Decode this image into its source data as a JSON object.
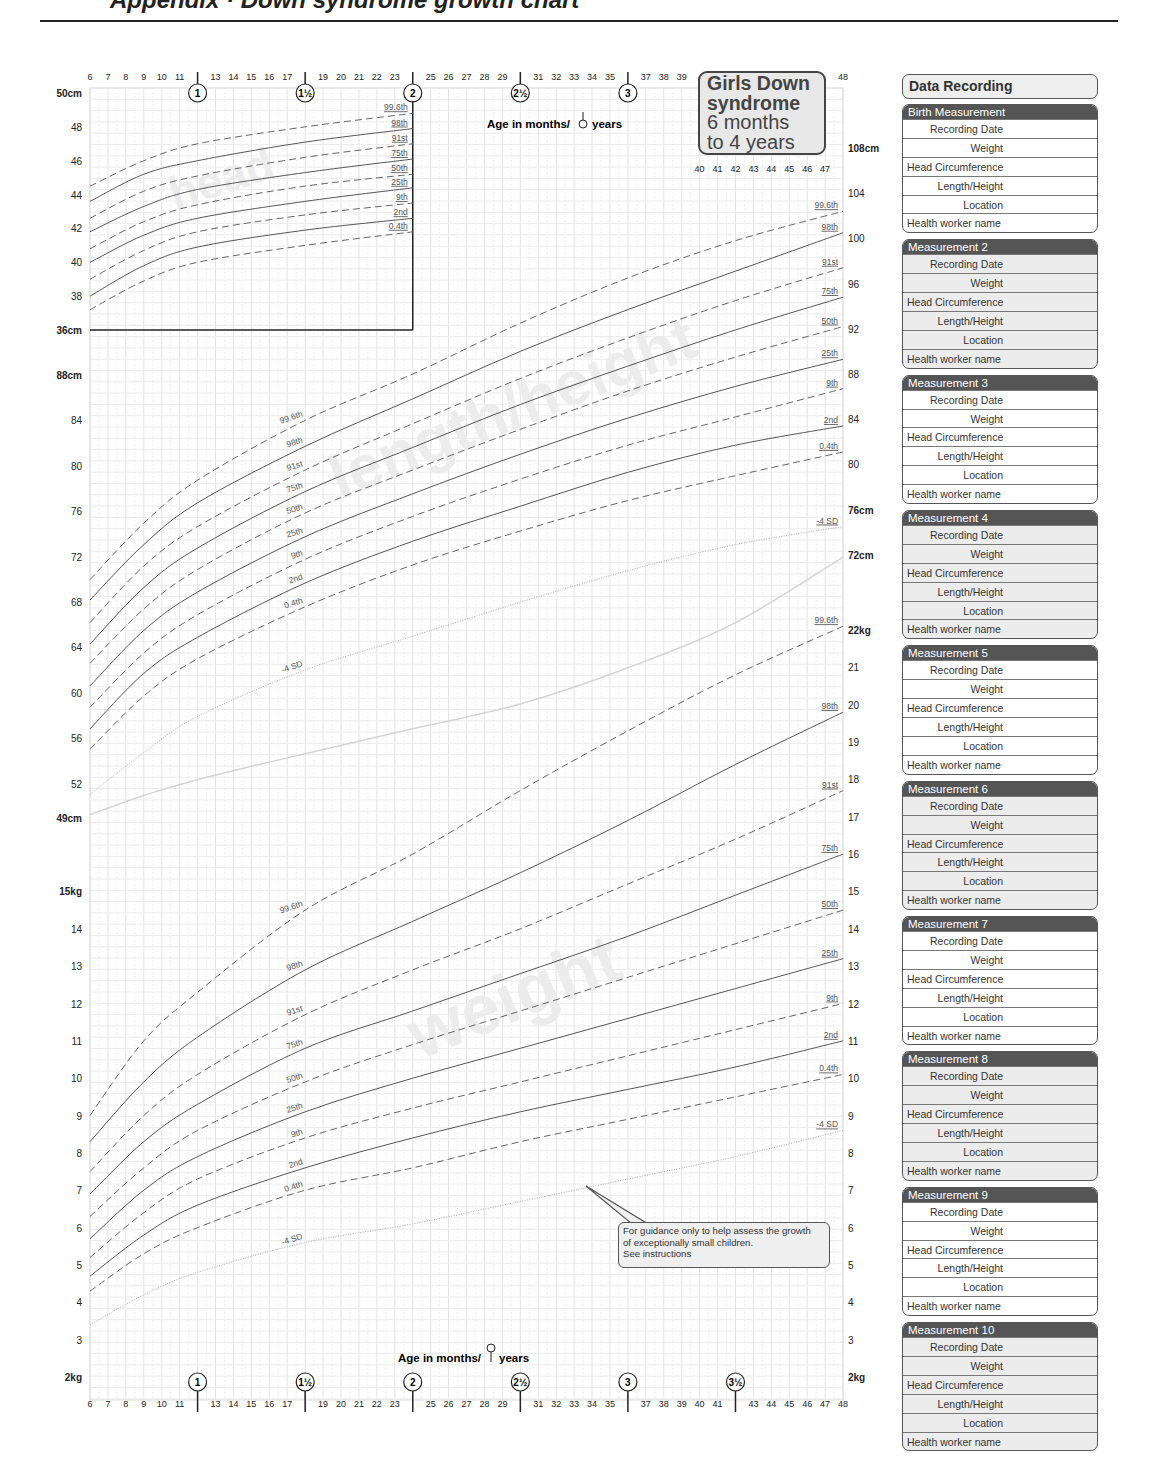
{
  "page": {
    "header_cut_text": "Appendix · Down syndrome growth chart",
    "title_box": {
      "line1": "Girls Down",
      "line2": "syndrome",
      "line3": "6 months",
      "line4": "to 4 years"
    }
  },
  "axes": {
    "top_months": [
      "6",
      "7",
      "8",
      "9",
      "10",
      "11",
      "13",
      "14",
      "15",
      "16",
      "17",
      "19",
      "20",
      "21",
      "22",
      "23",
      "25",
      "26",
      "27",
      "28",
      "29",
      "31",
      "32",
      "33",
      "34",
      "35",
      "37",
      "38",
      "39",
      "48"
    ],
    "inner_top_months": [
      "40",
      "41",
      "42",
      "43",
      "44",
      "45",
      "46",
      "47"
    ],
    "bottom_months": [
      "6",
      "7",
      "8",
      "9",
      "10",
      "11",
      "13",
      "14",
      "15",
      "16",
      "17",
      "19",
      "20",
      "21",
      "22",
      "23",
      "25",
      "26",
      "27",
      "28",
      "29",
      "31",
      "32",
      "33",
      "34",
      "35",
      "37",
      "38",
      "39",
      "40",
      "41",
      "43",
      "44",
      "45",
      "46",
      "47",
      "48"
    ],
    "year_markers_top": [
      "1",
      "1½",
      "2",
      "2½",
      "3"
    ],
    "year_markers_bottom": [
      "1",
      "1½",
      "2",
      "2½",
      "3",
      "3½"
    ],
    "top_age_label": "Age in months/",
    "top_age_label_suffix": "years",
    "bottom_age_label": "Age in months/",
    "bottom_age_label_suffix": "years",
    "head_ticks": [
      "50cm",
      "48",
      "46",
      "44",
      "42",
      "40",
      "38",
      "36cm"
    ],
    "length_left_ticks": [
      "88cm",
      "84",
      "80",
      "76",
      "72",
      "68",
      "64",
      "60",
      "56",
      "52",
      "49cm"
    ],
    "length_right_ticks": [
      "108cm",
      "104",
      "100",
      "96",
      "92",
      "88",
      "84",
      "80",
      "76cm",
      "72cm"
    ],
    "weight_left_ticks": [
      "15kg",
      "14",
      "13",
      "12",
      "11",
      "10",
      "9",
      "8",
      "7",
      "6",
      "5",
      "4",
      "3",
      "2kg"
    ],
    "weight_right_ticks": [
      "22kg",
      "21",
      "20",
      "19",
      "18",
      "17",
      "16",
      "15",
      "14",
      "13",
      "12",
      "11",
      "10",
      "9",
      "8",
      "7",
      "6",
      "5",
      "4",
      "3",
      "2kg"
    ]
  },
  "watermarks": {
    "head": "head",
    "length": "length/height",
    "weight": "weight"
  },
  "callout": {
    "line1": "For guidance only to help assess the growth",
    "line2": "of exceptionally small children.",
    "line3": "See instructions"
  },
  "sidebar": {
    "title": "Data Recording",
    "fields": [
      "Recording Date",
      "Weight",
      "Head Circumference",
      "Length/Height",
      "Location",
      "Health worker name"
    ],
    "cards": [
      {
        "title": "Birth Measurement"
      },
      {
        "title": "Measurement 2"
      },
      {
        "title": "Measurement 3"
      },
      {
        "title": "Measurement 4"
      },
      {
        "title": "Measurement 5"
      },
      {
        "title": "Measurement 6"
      },
      {
        "title": "Measurement 7"
      },
      {
        "title": "Measurement 8"
      },
      {
        "title": "Measurement 9"
      },
      {
        "title": "Measurement 10"
      }
    ]
  },
  "chart_data": [
    {
      "type": "line",
      "title": "head",
      "xlabel": "Age in months/years",
      "ylabel": "Head circumference (cm)",
      "x": [
        6,
        9,
        12,
        18,
        24
      ],
      "ylim": [
        36,
        50
      ],
      "grid": true,
      "series": [
        {
          "name": "99.6th",
          "style": "dashed",
          "values": [
            44.5,
            46.0,
            47.0,
            48.0,
            48.8
          ]
        },
        {
          "name": "98th",
          "style": "solid",
          "values": [
            43.6,
            45.2,
            46.0,
            47.1,
            47.9
          ]
        },
        {
          "name": "91st",
          "style": "dashed",
          "values": [
            42.6,
            44.2,
            45.1,
            46.2,
            47.0
          ]
        },
        {
          "name": "75th",
          "style": "solid",
          "values": [
            41.8,
            43.3,
            44.3,
            45.3,
            46.1
          ]
        },
        {
          "name": "50th",
          "style": "dashed",
          "values": [
            40.8,
            42.4,
            43.4,
            44.5,
            45.2
          ]
        },
        {
          "name": "25th",
          "style": "solid",
          "values": [
            40.0,
            41.6,
            42.6,
            43.6,
            44.4
          ]
        },
        {
          "name": "9th",
          "style": "dashed",
          "values": [
            39.0,
            40.7,
            41.8,
            42.8,
            43.5
          ]
        },
        {
          "name": "2nd",
          "style": "solid",
          "values": [
            38.0,
            39.8,
            40.9,
            41.9,
            42.6
          ]
        },
        {
          "name": "0.4th",
          "style": "dashed",
          "values": [
            37.2,
            38.9,
            40.0,
            41.0,
            41.8
          ]
        }
      ]
    },
    {
      "type": "line",
      "title": "length/height",
      "xlabel": "Age in months/years",
      "ylabel": "Length/Height (cm)",
      "x": [
        6,
        9,
        12,
        18,
        24,
        30,
        36,
        42,
        48
      ],
      "ylim": [
        49,
        108
      ],
      "grid": true,
      "series": [
        {
          "name": "99.6th",
          "style": "dashed",
          "values": [
            69.8,
            74.8,
            78.6,
            83.9,
            88.0,
            92.5,
            96.5,
            99.8,
            102.4
          ]
        },
        {
          "name": "98th",
          "style": "solid",
          "values": [
            68.0,
            72.9,
            76.6,
            81.6,
            85.8,
            90.0,
            93.7,
            97.1,
            100.5
          ]
        },
        {
          "name": "91st",
          "style": "dashed",
          "values": [
            66.0,
            71.0,
            74.5,
            79.5,
            83.6,
            87.6,
            91.2,
            94.5,
            97.4
          ]
        },
        {
          "name": "75th",
          "style": "solid",
          "values": [
            64.1,
            69.1,
            72.6,
            77.6,
            81.5,
            85.3,
            88.7,
            91.9,
            94.8
          ]
        },
        {
          "name": "50th",
          "style": "dashed",
          "values": [
            62.4,
            67.2,
            70.7,
            75.7,
            79.5,
            83.1,
            86.5,
            89.5,
            92.2
          ]
        },
        {
          "name": "25th",
          "style": "solid",
          "values": [
            60.4,
            65.3,
            68.7,
            73.6,
            77.4,
            80.9,
            84.1,
            86.9,
            89.3
          ]
        },
        {
          "name": "9th",
          "style": "dashed",
          "values": [
            58.5,
            63.3,
            66.7,
            71.6,
            75.4,
            78.7,
            81.7,
            84.2,
            86.7
          ]
        },
        {
          "name": "2nd",
          "style": "solid",
          "values": [
            56.6,
            61.5,
            64.7,
            69.5,
            73.2,
            76.3,
            79.3,
            81.7,
            83.4
          ]
        },
        {
          "name": "0.4th",
          "style": "dashed",
          "values": [
            54.8,
            59.5,
            62.8,
            67.4,
            71.1,
            74.1,
            76.8,
            79.0,
            81.1
          ]
        },
        {
          "name": "-4 SD",
          "style": "dotted",
          "values": [
            50.8,
            54.5,
            57.7,
            61.8,
            64.8,
            67.8,
            70.6,
            72.9,
            74.5
          ]
        },
        {
          "name": "lower limit",
          "style": "light",
          "values": [
            49.0,
            50.7,
            52.1,
            54.4,
            56.6,
            58.8,
            62.0,
            66.0,
            71.8
          ]
        }
      ]
    },
    {
      "type": "line",
      "title": "weight",
      "xlabel": "Age in months/years",
      "ylabel": "Weight (kg)",
      "x": [
        6,
        9,
        12,
        18,
        24,
        30,
        36,
        42,
        48
      ],
      "ylim": [
        2,
        22
      ],
      "grid": true,
      "series": [
        {
          "name": "99.6th",
          "style": "dashed",
          "values": [
            9.0,
            11.0,
            12.3,
            14.5,
            16.0,
            17.7,
            19.3,
            20.8,
            22.1
          ]
        },
        {
          "name": "98th",
          "style": "solid",
          "values": [
            8.3,
            9.9,
            11.1,
            12.9,
            14.2,
            15.5,
            16.9,
            18.4,
            19.8
          ]
        },
        {
          "name": "91st",
          "style": "dashed",
          "values": [
            7.5,
            9.0,
            10.1,
            11.7,
            12.9,
            14.0,
            15.2,
            16.4,
            17.7
          ]
        },
        {
          "name": "75th",
          "style": "solid",
          "values": [
            6.9,
            8.3,
            9.3,
            10.8,
            11.8,
            12.8,
            13.8,
            14.9,
            16.0
          ]
        },
        {
          "name": "50th",
          "style": "dashed",
          "values": [
            6.3,
            7.6,
            8.6,
            9.9,
            10.9,
            11.8,
            12.7,
            13.6,
            14.5
          ]
        },
        {
          "name": "25th",
          "style": "solid",
          "values": [
            5.7,
            7.0,
            7.9,
            9.1,
            10.0,
            10.8,
            11.6,
            12.4,
            13.2
          ]
        },
        {
          "name": "9th",
          "style": "dashed",
          "values": [
            5.2,
            6.4,
            7.3,
            8.4,
            9.2,
            9.9,
            10.6,
            11.3,
            12.0
          ]
        },
        {
          "name": "2nd",
          "style": "solid",
          "values": [
            4.7,
            5.8,
            6.6,
            7.6,
            8.4,
            9.1,
            9.7,
            10.3,
            11.0
          ]
        },
        {
          "name": "0.4th",
          "style": "dashed",
          "values": [
            4.3,
            5.3,
            6.0,
            7.0,
            7.6,
            8.3,
            8.9,
            9.5,
            10.1
          ]
        },
        {
          "name": "-4 SD",
          "style": "dotted",
          "values": [
            3.4,
            4.2,
            4.8,
            5.6,
            6.1,
            6.7,
            7.3,
            7.9,
            8.6
          ]
        }
      ]
    }
  ]
}
